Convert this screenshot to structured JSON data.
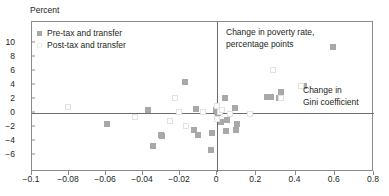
{
  "chart_data": {
    "type": "scatter",
    "title": "",
    "ylabel": "Percent",
    "xlabel": "",
    "annotations": [
      {
        "name": "poverty-rate-label",
        "text_line1": "Change in poverty rate,",
        "text_line2": "percentage points"
      },
      {
        "name": "gini-label",
        "text_line1": "Change in",
        "text_line2": "Gini coefficient"
      }
    ],
    "yticks": [
      10,
      8,
      6,
      4,
      2,
      0,
      -2,
      -4,
      -6
    ],
    "ytick_labels": [
      "10",
      "8",
      "6",
      "4",
      "2",
      "0",
      "−2",
      "−4",
      "−6"
    ],
    "ylim": [
      -6,
      10
    ],
    "xtick_labels": [
      "−0.1",
      "−0.08",
      "−0.06",
      "−0.04",
      "−0.02",
      "0",
      "0.2",
      "0.4",
      "0.6",
      "0.8"
    ],
    "xticks": [
      -0.1,
      -0.08,
      -0.06,
      -0.04,
      -0.02,
      0,
      0.2,
      0.4,
      0.6,
      0.8
    ],
    "xaxis_note": "broken scale: left segment -0.1 to 0 step 0.02; right segment 0 to 0.8 step 0.2",
    "grid": false,
    "legend_position": "top-left",
    "series": [
      {
        "name": "Pre-tax and transfer",
        "color": "#a8a8a8",
        "marker": "filled-square",
        "points": [
          {
            "x": -0.0595,
            "y": -1.6
          },
          {
            "x": -0.0375,
            "y": 0.4
          },
          {
            "x": -0.0345,
            "y": -4.7
          },
          {
            "x": -0.0305,
            "y": -3.2
          },
          {
            "x": -0.0295,
            "y": -3.3
          },
          {
            "x": -0.0175,
            "y": 4.5
          },
          {
            "x": -0.0125,
            "y": -2.4
          },
          {
            "x": -0.0115,
            "y": 0.6
          },
          {
            "x": -0.0105,
            "y": -3.1
          },
          {
            "x": -0.0035,
            "y": -5.3
          },
          {
            "x": -0.0025,
            "y": -2.8
          },
          {
            "x": -0.0005,
            "y": 0.5
          },
          {
            "x": 0.0,
            "y": 0.1
          },
          {
            "x": 0.005,
            "y": 0.0
          },
          {
            "x": 0.02,
            "y": -1.3
          },
          {
            "x": 0.04,
            "y": 2.2
          },
          {
            "x": 0.045,
            "y": -2.5
          },
          {
            "x": 0.05,
            "y": -1.0
          },
          {
            "x": 0.09,
            "y": 0.7
          },
          {
            "x": 0.095,
            "y": -2.4
          },
          {
            "x": 0.1,
            "y": -1.5
          },
          {
            "x": 0.255,
            "y": 2.3
          },
          {
            "x": 0.275,
            "y": 2.3
          },
          {
            "x": 0.315,
            "y": 2.2
          },
          {
            "x": 0.325,
            "y": 3.0
          },
          {
            "x": 0.445,
            "y": 3.8
          },
          {
            "x": 0.59,
            "y": 9.4
          }
        ]
      },
      {
        "name": "Post-tax and transfer",
        "color": "#f0f0f0",
        "marker": "open-square",
        "points": [
          {
            "x": -0.0805,
            "y": 0.8
          },
          {
            "x": -0.0445,
            "y": -0.6
          },
          {
            "x": -0.0255,
            "y": -1.2
          },
          {
            "x": -0.0225,
            "y": 2.2
          },
          {
            "x": -0.0205,
            "y": 0.1
          },
          {
            "x": -0.0165,
            "y": -1.9
          },
          {
            "x": -0.0075,
            "y": 0.2
          },
          {
            "x": 0.0,
            "y": 1.0
          },
          {
            "x": 0.0,
            "y": -0.9
          },
          {
            "x": 0.015,
            "y": 0.1
          },
          {
            "x": 0.025,
            "y": 0.4
          },
          {
            "x": 0.065,
            "y": -0.1
          },
          {
            "x": 0.17,
            "y": -0.2
          },
          {
            "x": 0.285,
            "y": 6.1
          },
          {
            "x": 0.325,
            "y": 2.2
          },
          {
            "x": 0.43,
            "y": 3.9
          }
        ]
      }
    ]
  }
}
